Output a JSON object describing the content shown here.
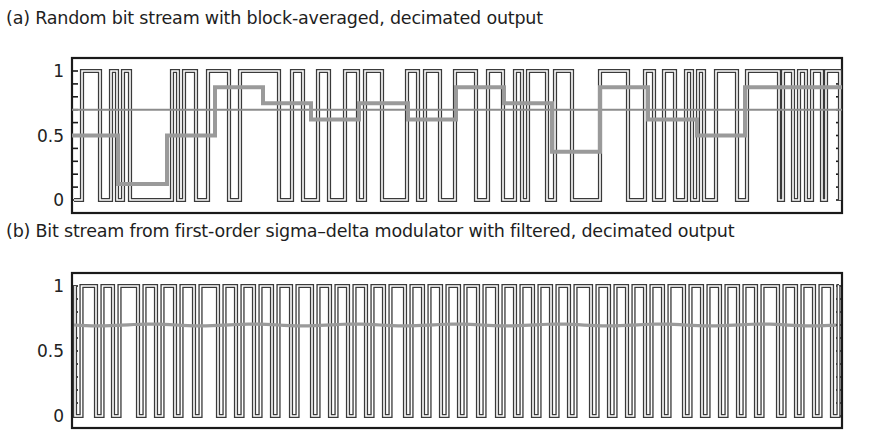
{
  "chart_data": [
    {
      "type": "line",
      "title": "(a) Random bit stream with block-averaged, decimated output",
      "xlabel": "",
      "ylabel": "",
      "ylim": [
        0,
        1
      ],
      "yticks": [
        "0",
        "0.5",
        "1"
      ],
      "minor_ytick_step": 0.1,
      "grid": false,
      "legend": null,
      "frame_px": {
        "left": 72,
        "right": 842,
        "top": 58,
        "bottom": 213,
        "y1": 71,
        "y0": 200
      },
      "series": [
        {
          "name": "bit stream",
          "style": "double-line pulse train",
          "color": "#333333",
          "start_level": 0,
          "edges_px": [
            82,
            100,
            111,
            117,
            123,
            130,
            172,
            178,
            184,
            196,
            208,
            229,
            240,
            279,
            292,
            303,
            318,
            329,
            345,
            358,
            365,
            382,
            407,
            418,
            425,
            440,
            455,
            476,
            488,
            503,
            515,
            522,
            528,
            547,
            555,
            572,
            600,
            628,
            645,
            654,
            664,
            675,
            686,
            692,
            698,
            704,
            716,
            737,
            747,
            779,
            783,
            793,
            799,
            806,
            812,
            822,
            826,
            840
          ],
          "values": "0/1 random bits"
        },
        {
          "name": "block-averaged, decimated output",
          "style": "thick gray staircase",
          "color": "#999999",
          "x_px": [
            72,
            118,
            167,
            215,
            263,
            311,
            359,
            408,
            456,
            504,
            552,
            600,
            648,
            697,
            745,
            842
          ],
          "values": [
            0.5,
            0.125,
            0.5,
            0.875,
            0.75,
            0.625,
            0.75,
            0.625,
            0.875,
            0.75,
            0.375,
            0.875,
            0.625,
            0.5,
            0.875
          ]
        },
        {
          "name": "true mean",
          "style": "thin gray horizontal line",
          "color": "#8a8a8a",
          "values": [
            0.7,
            0.7
          ]
        }
      ]
    },
    {
      "type": "line",
      "title": "(b) Bit stream from first-order sigma–delta modulator with filtered, decimated output",
      "xlabel": "",
      "ylabel": "",
      "ylim": [
        0,
        1
      ],
      "yticks": [
        "0",
        "0.5",
        "1"
      ],
      "minor_ytick_step": 0.1,
      "grid": false,
      "legend": null,
      "frame_px": {
        "left": 72,
        "right": 842,
        "top": 273,
        "bottom": 428,
        "y1": 286,
        "y0": 416
      },
      "series": [
        {
          "name": "sigma-delta bit stream",
          "style": "double-line pulse train",
          "color": "#333333",
          "pattern": "1 1 0 repeating with occasional 1 1 1 0 (duty ≈ 0.7)",
          "low_pulses_x_px": [
            74,
            96,
            113,
            138,
            156,
            175,
            194,
            218,
            236,
            254,
            272,
            291,
            312,
            330,
            348,
            366,
            384,
            405,
            423,
            441,
            459,
            478,
            497,
            515,
            533,
            551,
            569,
            591,
            609,
            627,
            645,
            663,
            684,
            702,
            720,
            738,
            756,
            778,
            796,
            814,
            832
          ]
        },
        {
          "name": "filtered, decimated output",
          "style": "thick gray line",
          "color": "#999999",
          "values": [
            0.7,
            0.7
          ]
        }
      ]
    }
  ],
  "captions": {
    "a": "(a) Random bit stream with block-averaged, decimated output",
    "b": "(b) Bit stream from first-order sigma–delta modulator with filtered, decimated output"
  },
  "axes": {
    "ytick_labels": {
      "one": "1",
      "half": "0.5",
      "zero": "0"
    }
  },
  "colors": {
    "frame": "#1a1a1a",
    "bitstream": "#3a3a3a",
    "average": "#9a9a9a",
    "mean_line": "#8c8c8c"
  }
}
